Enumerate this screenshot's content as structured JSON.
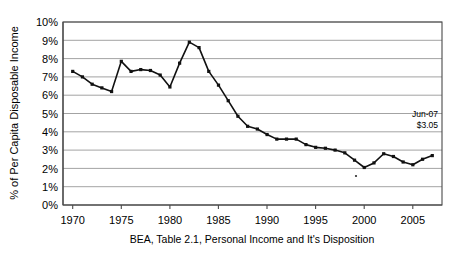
{
  "chart_data": {
    "type": "line",
    "title": "",
    "subtitle": "",
    "xlabel": "",
    "ylabel": "% of Per Capita Disposable Income",
    "footnote": "BEA, Table 2.1, Personal Income and It's Disposition",
    "grid": true,
    "legend": "none",
    "xlim": [
      1969.0,
      2008.0
    ],
    "ylim": [
      0,
      10
    ],
    "y_tick_labels": [
      "0%",
      "1%",
      "2%",
      "3%",
      "4%",
      "5%",
      "6%",
      "7%",
      "8%",
      "9%",
      "10%"
    ],
    "y_tick_values": [
      0,
      1,
      2,
      3,
      4,
      5,
      6,
      7,
      8,
      9,
      10
    ],
    "x_tick_labels": [
      "1970",
      "1975",
      "1980",
      "1985",
      "1990",
      "1995",
      "2000",
      "2005"
    ],
    "x_tick_values": [
      1970,
      1975,
      1980,
      1985,
      1990,
      1995,
      2000,
      2005
    ],
    "series": [
      {
        "name": "Personal Savings Rate",
        "color": "#111111",
        "x": [
          1970,
          1971,
          1972,
          1973,
          1974,
          1975,
          1976,
          1977,
          1978,
          1979,
          1980,
          1981,
          1982,
          1983,
          1984,
          1985,
          1986,
          1987,
          1988,
          1989,
          1990,
          1991,
          1992,
          1993,
          1994,
          1995,
          1996,
          1997,
          1998,
          1999,
          2000,
          2001,
          2002,
          2003,
          2004,
          2005,
          2006,
          2007
        ],
        "values": [
          7.3,
          7.0,
          6.6,
          6.4,
          6.2,
          7.85,
          7.3,
          7.4,
          7.35,
          7.1,
          6.45,
          7.75,
          8.9,
          8.6,
          7.3,
          6.55,
          5.7,
          4.85,
          4.3,
          4.15,
          3.85,
          3.6,
          3.6,
          3.6,
          3.3,
          3.15,
          3.1,
          3.0,
          2.85,
          2.45,
          2.05,
          2.3,
          2.8,
          2.65,
          2.35,
          2.2,
          2.5,
          2.7
        ]
      }
    ],
    "annotation": {
      "date_label": "Jun-07",
      "value_label": "$3.05"
    }
  }
}
